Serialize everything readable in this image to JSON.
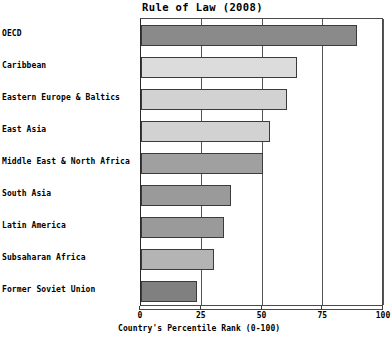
{
  "chart_data": {
    "type": "bar",
    "orientation": "horizontal",
    "title": "Rule of Law (2008)",
    "xlabel": "Country's Percentile Rank (0-100)",
    "ylabel": "",
    "xlim": [
      0,
      100
    ],
    "xticks": [
      0,
      25,
      50,
      75,
      100
    ],
    "xtick_labels": [
      "0",
      "25",
      "50",
      "75",
      "100"
    ],
    "grid": true,
    "grid_axis": "x",
    "legend": false,
    "categories": [
      "OECD",
      "Caribbean",
      "Eastern Europe & Baltics",
      "East Asia",
      "Middle East & North Africa",
      "South Asia",
      "Latin America",
      "Subsaharan Africa",
      "Former Soviet Union"
    ],
    "values": [
      89,
      64,
      60,
      53,
      50,
      37,
      34,
      30,
      23
    ],
    "bar_colors": [
      "#8a8a8a",
      "#dcdcdc",
      "#d2d2d2",
      "#d2d2d2",
      "#a0a0a0",
      "#9a9a9a",
      "#9a9a9a",
      "#b4b4b4",
      "#808080"
    ]
  },
  "colors": {
    "background": "#ffffff",
    "frame": "#4a4a4a",
    "gridline": "#555555",
    "bar_edge": "#3b3b3b",
    "text": "#000000"
  }
}
